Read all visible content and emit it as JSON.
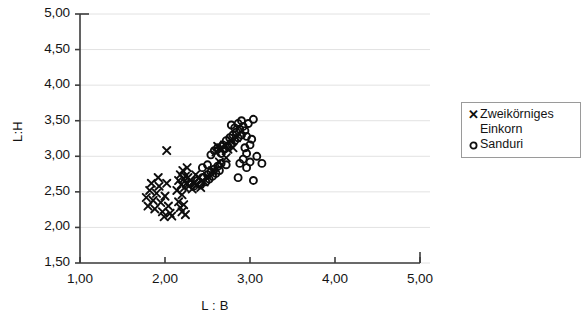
{
  "chart_data": {
    "type": "scatter",
    "title": "",
    "xlabel": "L : B",
    "ylabel": "L:H",
    "xlim": [
      1.0,
      5.0
    ],
    "ylim": [
      1.5,
      5.0
    ],
    "xticks": [
      "1,00",
      "2,00",
      "3,00",
      "4,00",
      "5,00"
    ],
    "xtick_values": [
      1.0,
      2.0,
      3.0,
      4.0,
      5.0
    ],
    "yticks": [
      "1,50",
      "2,00",
      "2,50",
      "3,00",
      "3,50",
      "4,00",
      "4,50",
      "5,00"
    ],
    "ytick_values": [
      1.5,
      2.0,
      2.5,
      3.0,
      3.5,
      4.0,
      4.5,
      5.0
    ],
    "grid": "horizontal",
    "legend_position": "right",
    "series": [
      {
        "name": "Zweikörniges Einkorn",
        "marker": "x",
        "color": "#0d0d0d",
        "points": [
          [
            1.78,
            2.42
          ],
          [
            1.8,
            2.3
          ],
          [
            1.82,
            2.52
          ],
          [
            1.84,
            2.62
          ],
          [
            1.86,
            2.38
          ],
          [
            1.88,
            2.26
          ],
          [
            1.9,
            2.48
          ],
          [
            1.92,
            2.7
          ],
          [
            1.93,
            2.58
          ],
          [
            1.95,
            2.35
          ],
          [
            1.97,
            2.22
          ],
          [
            1.99,
            2.15
          ],
          [
            2.0,
            2.44
          ],
          [
            2.02,
            2.62
          ],
          [
            2.04,
            2.3
          ],
          [
            2.06,
            2.2
          ],
          [
            2.08,
            2.16
          ],
          [
            2.02,
            3.08
          ],
          [
            2.14,
            2.52
          ],
          [
            2.16,
            2.66
          ],
          [
            2.18,
            2.74
          ],
          [
            2.19,
            2.6
          ],
          [
            2.2,
            2.46
          ],
          [
            2.21,
            2.8
          ],
          [
            2.22,
            2.68
          ],
          [
            2.23,
            2.56
          ],
          [
            2.24,
            2.72
          ],
          [
            2.25,
            2.62
          ],
          [
            2.26,
            2.84
          ],
          [
            2.27,
            2.7
          ],
          [
            2.28,
            2.58
          ],
          [
            2.3,
            2.66
          ],
          [
            2.32,
            2.54
          ],
          [
            2.34,
            2.62
          ],
          [
            2.36,
            2.74
          ],
          [
            2.16,
            2.36
          ],
          [
            2.18,
            2.28
          ],
          [
            2.2,
            2.22
          ],
          [
            2.22,
            2.32
          ],
          [
            2.24,
            2.18
          ],
          [
            2.38,
            2.6
          ],
          [
            2.4,
            2.7
          ],
          [
            2.42,
            2.56
          ],
          [
            2.46,
            2.64
          ],
          [
            2.5,
            2.72
          ],
          [
            2.56,
            2.8
          ],
          [
            2.6,
            3.06
          ],
          [
            2.62,
            3.14
          ],
          [
            2.66,
            3.08
          ],
          [
            2.7,
            3.16
          ],
          [
            2.74,
            3.1
          ],
          [
            2.78,
            3.22
          ],
          [
            2.8,
            3.12
          ],
          [
            2.84,
            3.26
          ],
          [
            2.64,
            2.92
          ],
          [
            2.72,
            2.98
          ]
        ]
      },
      {
        "name": "Sanduri",
        "marker": "o",
        "color": "#0d0d0d",
        "points": [
          [
            2.3,
            2.62
          ],
          [
            2.34,
            2.58
          ],
          [
            2.38,
            2.66
          ],
          [
            2.42,
            2.6
          ],
          [
            2.44,
            2.7
          ],
          [
            2.48,
            2.64
          ],
          [
            2.5,
            2.74
          ],
          [
            2.52,
            2.68
          ],
          [
            2.54,
            2.78
          ],
          [
            2.56,
            2.72
          ],
          [
            2.58,
            2.82
          ],
          [
            2.6,
            2.76
          ],
          [
            2.62,
            2.86
          ],
          [
            2.64,
            2.8
          ],
          [
            2.66,
            2.9
          ],
          [
            2.54,
            3.02
          ],
          [
            2.58,
            3.08
          ],
          [
            2.62,
            3.12
          ],
          [
            2.66,
            3.04
          ],
          [
            2.68,
            3.16
          ],
          [
            2.7,
            3.1
          ],
          [
            2.72,
            3.22
          ],
          [
            2.74,
            3.14
          ],
          [
            2.76,
            3.26
          ],
          [
            2.78,
            3.18
          ],
          [
            2.8,
            3.3
          ],
          [
            2.82,
            3.22
          ],
          [
            2.84,
            3.34
          ],
          [
            2.86,
            3.26
          ],
          [
            2.88,
            3.38
          ],
          [
            2.9,
            3.3
          ],
          [
            2.92,
            3.42
          ],
          [
            2.86,
            3.46
          ],
          [
            2.9,
            3.5
          ],
          [
            2.94,
            3.36
          ],
          [
            2.96,
            3.28
          ],
          [
            2.78,
            3.44
          ],
          [
            2.82,
            3.4
          ],
          [
            2.94,
            3.12
          ],
          [
            2.96,
            3.04
          ],
          [
            3.0,
            3.16
          ],
          [
            3.02,
            3.24
          ],
          [
            3.04,
            3.52
          ],
          [
            2.98,
            3.46
          ],
          [
            2.92,
            2.96
          ],
          [
            2.88,
            2.9
          ],
          [
            2.96,
            2.84
          ],
          [
            3.0,
            2.92
          ],
          [
            3.14,
            2.9
          ],
          [
            3.04,
            2.66
          ],
          [
            3.08,
            3.0
          ],
          [
            2.86,
            2.7
          ],
          [
            2.72,
            2.88
          ],
          [
            2.5,
            2.88
          ],
          [
            2.44,
            2.84
          ]
        ]
      }
    ]
  },
  "legend": {
    "entries": [
      {
        "marker": "✕",
        "label": "Zweikörniges\nEinkorn"
      },
      {
        "marker": "⭕",
        "label": "Sanduri"
      }
    ]
  }
}
